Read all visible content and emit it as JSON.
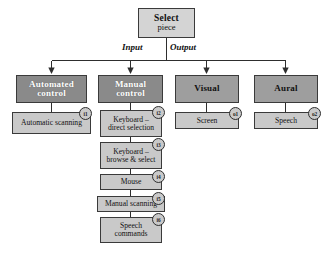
{
  "diagram": {
    "root": {
      "title": "Select",
      "subtitle": "piece"
    },
    "branch_labels": {
      "input": "Input",
      "output": "Output"
    },
    "input_side": {
      "automated": {
        "head": "Automated control",
        "head_line1": "Automated",
        "head_line2": "control",
        "children": [
          {
            "label": "Automatic scanning",
            "line1": "Automatic scanning",
            "line2": "",
            "badge": "i1"
          }
        ]
      },
      "manual": {
        "head": "Manual control",
        "head_line1": "Manual",
        "head_line2": "control",
        "children": [
          {
            "label": "Keyboard – direct selection",
            "line1": "Keyboard –",
            "line2": "direct selection",
            "badge": "i2"
          },
          {
            "label": "Keyboard – browse & select",
            "line1": "Keyboard –",
            "line2": "browse & select",
            "badge": "i3"
          },
          {
            "label": "Mouse",
            "line1": "Mouse",
            "line2": "",
            "badge": "i4"
          },
          {
            "label": "Manual scanning",
            "line1": "Manual scanning",
            "line2": "",
            "badge": "i5"
          },
          {
            "label": "Speech commands",
            "line1": "Speech",
            "line2": "commands",
            "badge": "i6"
          }
        ]
      }
    },
    "output_side": {
      "visual": {
        "head": "Visual",
        "children": [
          {
            "label": "Screen",
            "line1": "Screen",
            "line2": "",
            "badge": "o1"
          }
        ]
      },
      "aural": {
        "head": "Aural",
        "children": [
          {
            "label": "Speech",
            "line1": "Speech",
            "line2": "",
            "badge": "o2"
          }
        ]
      }
    },
    "colors": {
      "head_dark": "#8a8a8a",
      "head_mid": "#9e9e9e",
      "leaf": "#c9c9c9",
      "root": "#d4d4d4",
      "line": "#2e2e2e",
      "background": "#ffffff"
    }
  }
}
